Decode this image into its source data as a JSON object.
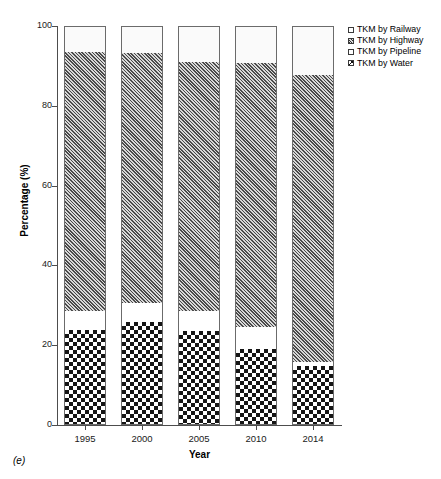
{
  "panel_label": "(e)",
  "axes": {
    "y_title": "Percentage (%)",
    "x_title": "Year",
    "y_ticks": [
      "0",
      "20",
      "40",
      "60",
      "80",
      "100"
    ],
    "x_ticks": [
      "1995",
      "2000",
      "2005",
      "2010",
      "2014"
    ]
  },
  "legend": {
    "items": [
      {
        "label": "TKM by Railway",
        "key": "railway"
      },
      {
        "label": "TKM by Highway",
        "key": "highway"
      },
      {
        "label": "TKM by Pipeline",
        "key": "pipeline"
      },
      {
        "label": "TKM by Water",
        "key": "water"
      }
    ]
  },
  "chart_data": {
    "type": "bar",
    "subtype": "stacked-bar-100-percent",
    "title": "",
    "xlabel": "Year",
    "ylabel": "Percentage (%)",
    "ylim": [
      0,
      100
    ],
    "yticks": [
      0,
      20,
      40,
      60,
      80,
      100
    ],
    "grid": false,
    "legend_position": "top-right-outside",
    "categories": [
      "1995",
      "2000",
      "2005",
      "2010",
      "2014"
    ],
    "series": [
      {
        "name": "TKM by Water",
        "pattern": "checkerboard",
        "values": [
          23.8,
          25.8,
          23.6,
          19.0,
          14.8
        ]
      },
      {
        "name": "TKM by Pipeline",
        "pattern": "empty-white",
        "values": [
          4.8,
          4.8,
          5.0,
          5.6,
          1.0
        ]
      },
      {
        "name": "TKM by Highway",
        "pattern": "diagonal-hatch",
        "values": [
          64.9,
          62.6,
          62.3,
          66.1,
          71.9
        ]
      },
      {
        "name": "TKM by Railway",
        "pattern": "light-stipple",
        "values": [
          6.5,
          6.8,
          9.1,
          9.3,
          12.3
        ]
      }
    ],
    "cumulative_tops": {
      "1995": {
        "water": 23.8,
        "pipeline": 28.6,
        "highway": 93.5,
        "railway": 100
      },
      "2000": {
        "water": 25.8,
        "pipeline": 30.6,
        "highway": 93.2,
        "railway": 100
      },
      "2005": {
        "water": 23.6,
        "pipeline": 28.6,
        "highway": 90.9,
        "railway": 100
      },
      "2010": {
        "water": 19.0,
        "pipeline": 24.6,
        "highway": 90.7,
        "railway": 100
      },
      "2014": {
        "water": 14.8,
        "pipeline": 15.8,
        "highway": 87.7,
        "railway": 100
      }
    }
  },
  "colors": {
    "axis": "#4d4d4d",
    "bar_outline": "#6b6b6b",
    "text": "#000000"
  }
}
